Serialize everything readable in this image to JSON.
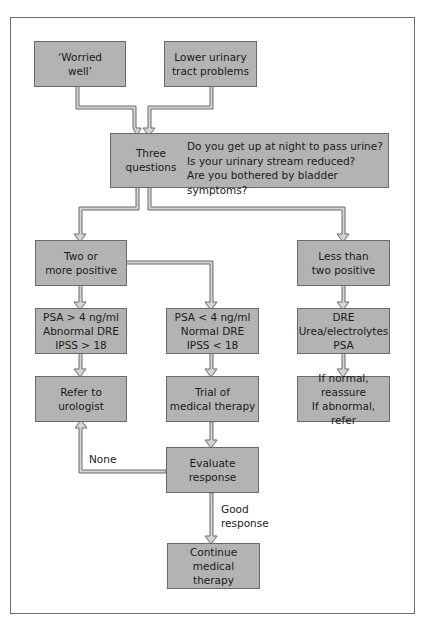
{
  "diagram": {
    "type": "flowchart",
    "colors": {
      "box_fill": "#b3b3b3",
      "box_border": "#6a6a6a",
      "connector": "#6a6a6a",
      "connector_fill": "#cfcfcf"
    },
    "nodes": {
      "worried_well": {
        "line1": "‘Worried",
        "line2": "well’"
      },
      "luts": {
        "line1": "Lower urinary",
        "line2": "tract problems"
      },
      "three_questions": {
        "label_line1": "Three",
        "label_line2": "questions",
        "questions": [
          "Do you get up at night to pass urine?",
          "Is your urinary stream reduced?",
          "Are you bothered by bladder symptoms?"
        ]
      },
      "two_or_more": {
        "line1": "Two or",
        "line2": "more positive"
      },
      "less_than_two": {
        "line1": "Less than",
        "line2": "two positive"
      },
      "psa_high": {
        "line1": "PSA > 4 ng/ml",
        "line2": "Abnormal DRE",
        "line3": "IPSS > 18"
      },
      "psa_low": {
        "line1": "PSA < 4 ng/ml",
        "line2": "Normal DRE",
        "line3": "IPSS < 18"
      },
      "tests": {
        "line1": "DRE",
        "line2": "Urea/electrolytes",
        "line3": "PSA"
      },
      "refer": {
        "line1": "Refer to",
        "line2": "urologist"
      },
      "trial": {
        "line1": "Trial of",
        "line2": "medical therapy"
      },
      "normal_abnormal": {
        "line1": "If normal, reassure",
        "line2": "If abnormal, refer"
      },
      "evaluate": {
        "line1": "Evaluate",
        "line2": "response"
      },
      "continue": {
        "line1": "Continue medical",
        "line2": "therapy"
      }
    },
    "edge_labels": {
      "none": "None",
      "good_line1": "Good",
      "good_line2": "response"
    }
  }
}
